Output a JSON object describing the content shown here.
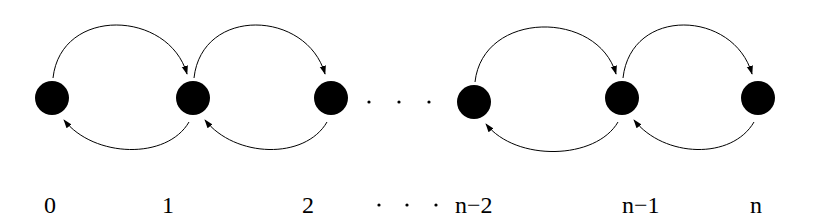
{
  "diagram": {
    "type": "birth-death chain",
    "nodes": [
      {
        "id": "0",
        "label": "0"
      },
      {
        "id": "1",
        "label": "1"
      },
      {
        "id": "2",
        "label": "2"
      },
      {
        "id": "n-2",
        "label": "n−2"
      },
      {
        "id": "n-1",
        "label": "n−1"
      },
      {
        "id": "n",
        "label": "n"
      }
    ],
    "ellipsis_between": [
      "2",
      "n-2"
    ],
    "ellipsis_glyph": ". . .",
    "edges": [
      {
        "from": "0",
        "to": "1"
      },
      {
        "from": "1",
        "to": "0"
      },
      {
        "from": "1",
        "to": "2"
      },
      {
        "from": "2",
        "to": "1"
      },
      {
        "from": "n-2",
        "to": "n-1"
      },
      {
        "from": "n-1",
        "to": "n-2"
      },
      {
        "from": "n-1",
        "to": "n"
      },
      {
        "from": "n",
        "to": "n-1"
      }
    ],
    "colors": {
      "node": "#000000",
      "edge": "#000000",
      "background": "#ffffff"
    }
  }
}
